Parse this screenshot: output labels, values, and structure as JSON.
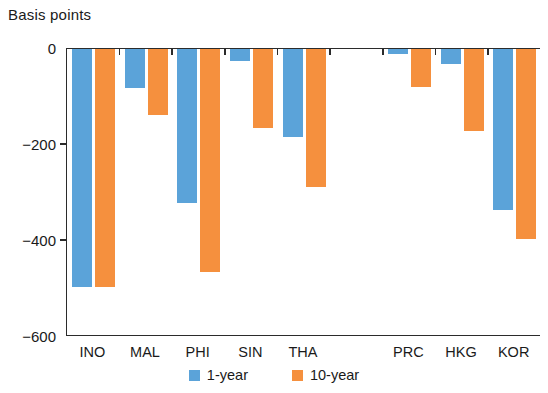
{
  "chart_data": {
    "type": "bar",
    "title": "Basis points",
    "xlabel": "",
    "ylabel": "Basis points",
    "ylim": [
      -600,
      0
    ],
    "yticks": [
      0,
      -200,
      -400,
      -600
    ],
    "ytick_labels": [
      "0",
      "−200",
      "−400",
      "−600"
    ],
    "grid": false,
    "legend_position": "bottom-center",
    "categories": [
      "INO",
      "MAL",
      "PHI",
      "SIN",
      "THA",
      "",
      "PRC",
      "HKG",
      "KOR"
    ],
    "series": [
      {
        "name": "1-year",
        "color": "#5ba3d9",
        "values": [
          -495,
          -82,
          -320,
          -25,
          -183,
          null,
          -10,
          -32,
          -335
        ]
      },
      {
        "name": "10-year",
        "color": "#f5903e",
        "values": [
          -495,
          -137,
          -465,
          -165,
          -288,
          null,
          -80,
          -170,
          -395
        ]
      }
    ],
    "legend": [
      {
        "label": "1-year",
        "color": "#5ba3d9"
      },
      {
        "label": "10-year",
        "color": "#f5903e"
      }
    ]
  },
  "colors": {
    "series_1_year": "#5ba3d9",
    "series_10_year": "#f5903e",
    "axis": "#2b2b2b",
    "text": "#1a1a1a",
    "background": "#ffffff"
  }
}
